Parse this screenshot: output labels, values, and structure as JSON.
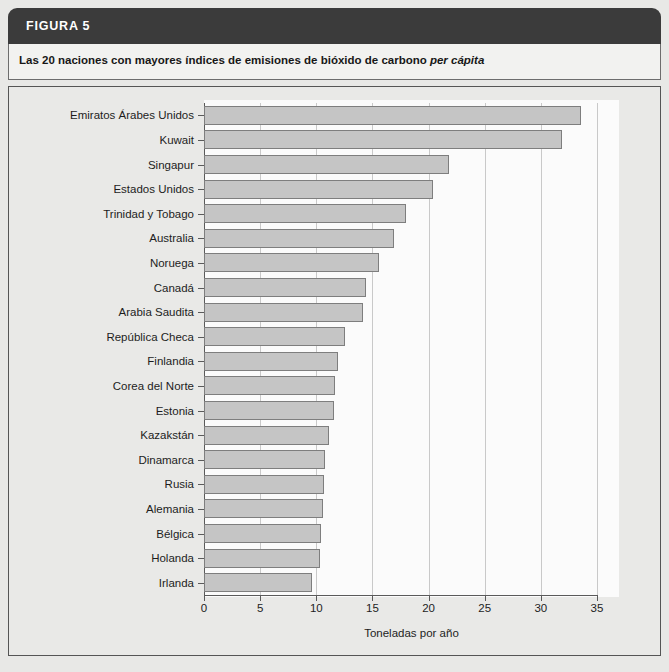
{
  "figure": {
    "header_label": "FIGURA 5",
    "subtitle_prefix": "Las 20 naciones con mayores índices de emisiones de bióxido de carbono ",
    "subtitle_italic": "per cápita"
  },
  "colors": {
    "header_band": "#3b3b3b",
    "subtitle_band": "#f2f2f0",
    "frame_background": "#e9e9e7",
    "plot_background": "#fbfbfb",
    "bar_fill": "#c5c5c5",
    "bar_stroke": "#7e7e7e",
    "axis": "#5a5a5a",
    "gridline": "#c9c9c9",
    "text": "#1d1d1d"
  },
  "chart_data": {
    "type": "bar",
    "orientation": "horizontal",
    "title": "Las 20 naciones con mayores índices de emisiones de bióxido de carbono per cápita",
    "xlabel": "Toneladas por año",
    "ylabel": "",
    "xlim": [
      0,
      35
    ],
    "xticks": [
      0,
      5,
      10,
      15,
      20,
      25,
      30,
      35
    ],
    "xtick_labels": [
      "0",
      "5",
      "10",
      "15",
      "20",
      "25",
      "30",
      "35"
    ],
    "grid": "vertical",
    "legend": "none",
    "categories": [
      "Emiratos Árabes Unidos",
      "Kuwait",
      "Singapur",
      "Estados Unidos",
      "Trinidad y Tobago",
      "Australia",
      "Noruega",
      "Canadá",
      "Arabia Saudita",
      "República Checa",
      "Finlandia",
      "Corea del Norte",
      "Estonia",
      "Kazakstán",
      "Dinamarca",
      "Rusia",
      "Alemania",
      "Bélgica",
      "Holanda",
      "Irlanda"
    ],
    "values": [
      33.6,
      31.9,
      21.8,
      20.4,
      18.0,
      16.9,
      15.6,
      14.4,
      14.2,
      12.6,
      11.9,
      11.7,
      11.6,
      11.1,
      10.8,
      10.7,
      10.6,
      10.4,
      10.3,
      9.6
    ]
  }
}
